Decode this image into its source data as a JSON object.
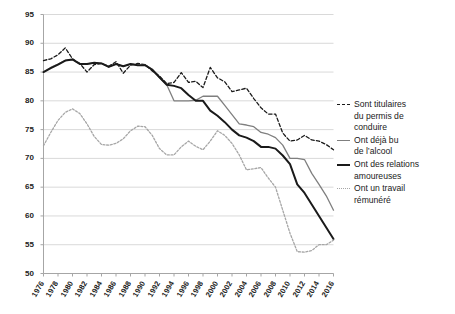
{
  "chart_data": {
    "type": "line",
    "title": "",
    "subtitle": "",
    "xlabel": "",
    "ylabel": "",
    "xlim": [
      1976,
      2016
    ],
    "ylim": [
      50,
      95
    ],
    "yticks": [
      50,
      55,
      60,
      65,
      70,
      75,
      80,
      85,
      90,
      95
    ],
    "grid": "horizontal",
    "legend_position": "right",
    "x": [
      1976,
      1977,
      1978,
      1979,
      1980,
      1981,
      1982,
      1983,
      1984,
      1985,
      1986,
      1987,
      1988,
      1989,
      1990,
      1991,
      1992,
      1993,
      1994,
      1995,
      1996,
      1997,
      1998,
      1999,
      2000,
      2001,
      2002,
      2003,
      2004,
      2005,
      2006,
      2007,
      2008,
      2009,
      2010,
      2011,
      2012,
      2013,
      2014,
      2015,
      2016
    ],
    "xticks": [
      "1976",
      "1978",
      "1980",
      "1982",
      "1984",
      "1986",
      "1988",
      "1990",
      "1992",
      "1994",
      "1996",
      "1998",
      "2000",
      "2002",
      "2004",
      "2006",
      "2008",
      "2010",
      "2012",
      "2014",
      "2016"
    ],
    "series": [
      {
        "name": "Sont titulaires du permis de conduire",
        "style": "dashed",
        "color": "#1a1a1a",
        "width": 1.3,
        "values": [
          87.0,
          87.3,
          88.0,
          89.2,
          87.3,
          86.5,
          85.0,
          86.3,
          86.5,
          86.0,
          86.8,
          84.8,
          86.2,
          86.5,
          86.3,
          85.2,
          84.3,
          83.0,
          83.2,
          84.9,
          83.2,
          83.4,
          82.3,
          85.8,
          84.0,
          83.3,
          81.6,
          81.9,
          82.2,
          80.4,
          78.8,
          77.7,
          77.7,
          74.4,
          73.0,
          73.2,
          74.0,
          73.2,
          73.0,
          72.4,
          71.5
        ]
      },
      {
        "name": "Ont déjà bu de l'alcool",
        "style": "solid",
        "color": "#7f7f7f",
        "width": 1.3,
        "values": [
          85.0,
          85.8,
          86.4,
          87.0,
          87.2,
          86.4,
          86.4,
          86.6,
          86.5,
          85.9,
          86.4,
          86.0,
          86.4,
          86.2,
          86.2,
          85.5,
          84.0,
          82.8,
          80.0,
          80.0,
          80.0,
          80.1,
          80.8,
          80.8,
          80.8,
          79.2,
          77.6,
          76.0,
          75.8,
          75.5,
          74.5,
          74.2,
          73.6,
          72.3,
          70.0,
          70.0,
          69.8,
          67.4,
          65.5,
          63.5,
          61.0
        ]
      },
      {
        "name": "Ont des relations amoureuses",
        "style": "solid",
        "color": "#1a1a1a",
        "width": 2.0,
        "values": [
          85.0,
          85.7,
          86.3,
          87.0,
          87.2,
          86.4,
          86.4,
          86.6,
          86.5,
          85.9,
          86.4,
          86.0,
          86.4,
          86.2,
          86.2,
          85.4,
          84.1,
          82.8,
          82.6,
          82.2,
          81.0,
          80.0,
          80.0,
          78.3,
          77.4,
          76.3,
          75.0,
          74.0,
          73.6,
          73.0,
          72.0,
          72.0,
          71.7,
          70.5,
          69.0,
          65.5,
          64.0,
          62.0,
          60.0,
          58.0,
          56.0
        ]
      },
      {
        "name": "Ont un travail rémunéré",
        "style": "dotted",
        "color": "#a6a6a6",
        "width": 1.3,
        "values": [
          72.2,
          74.5,
          76.6,
          78.0,
          78.6,
          77.8,
          76.0,
          73.8,
          72.4,
          72.3,
          72.6,
          73.4,
          74.8,
          75.6,
          75.5,
          74.0,
          71.7,
          70.6,
          70.6,
          72.0,
          73.0,
          72.1,
          71.5,
          73.0,
          74.8,
          74.0,
          72.6,
          70.6,
          68.0,
          68.2,
          68.4,
          66.6,
          65.0,
          61.0,
          57.0,
          53.8,
          53.7,
          54.0,
          55.0,
          55.0,
          55.8
        ]
      }
    ]
  },
  "legend": {
    "items": [
      {
        "label": "Sont titulaires\ndu permis de\nconduire",
        "style": "dashed",
        "color": "#1a1a1a",
        "width": 1.3
      },
      {
        "label": "Ont déjà bu\nde l’alcool",
        "style": "solid",
        "color": "#7f7f7f",
        "width": 1.3
      },
      {
        "label": "Ont des relations\namoureuses",
        "style": "solid",
        "color": "#1a1a1a",
        "width": 2.0
      },
      {
        "label": "Ont un travail\nrémunéré",
        "style": "dotted",
        "color": "#a6a6a6",
        "width": 1.3
      }
    ]
  },
  "axes": {
    "y_tick_labels": [
      "95",
      "90",
      "85",
      "80",
      "75",
      "70",
      "65",
      "60",
      "55",
      "50"
    ],
    "x_tick_labels": [
      "1976",
      "1978",
      "1980",
      "1982",
      "1984",
      "1986",
      "1988",
      "1990",
      "1992",
      "1994",
      "1996",
      "1998",
      "2000",
      "2002",
      "2004",
      "2006",
      "2008",
      "2010",
      "2012",
      "2014",
      "2016"
    ]
  },
  "colors": {
    "gridline": "#d9d9d9",
    "axis": "#a6a6a6",
    "text": "#222222"
  }
}
